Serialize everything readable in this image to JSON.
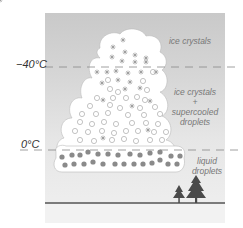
{
  "temperatures": {
    "minus40": "−40°C",
    "zero": "0°C"
  },
  "labels": {
    "ice_crystals": "ice crystals",
    "mixed_line1": "ice crystals",
    "mixed_plus": "+",
    "mixed_line2": "supercooled",
    "mixed_line3": "droplets",
    "liquid_line1": "liquid",
    "liquid_line2": "droplets"
  },
  "colors": {
    "sky_top": "#c9c9c9",
    "sky_bottom": "#f0f0f0",
    "cloud": "#ffffff",
    "droplet_liquid": "#8a8a8a",
    "droplet_outline": "#aaaaaa",
    "ground_line": "#555555",
    "tree": "#4a4a4a"
  },
  "icons": [
    "ice-crystal-icon",
    "supercooled-droplet-icon",
    "liquid-droplet-icon",
    "tree-icon"
  ]
}
